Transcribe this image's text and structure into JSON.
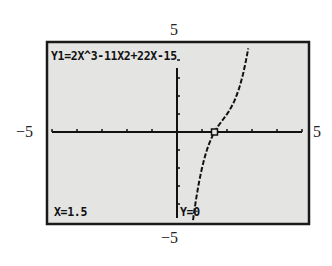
{
  "chart_data": {
    "type": "line",
    "title": "Y1=2X^3-11X2+22X-15",
    "function": "2x^3 - 11x^2 + 22x - 15",
    "xlim": [
      -5,
      5
    ],
    "ylim": [
      -5,
      5
    ],
    "xlabel": "",
    "ylabel": "",
    "grid": false,
    "x_tick_step": 1,
    "y_tick_step": 1,
    "series": [
      {
        "name": "Y1",
        "x": [
          0.6,
          0.7,
          0.8,
          0.9,
          1.0,
          1.1,
          1.2,
          1.3,
          1.4,
          1.5,
          1.6,
          1.7,
          1.8,
          1.9,
          2.0,
          2.1,
          2.2,
          2.3,
          2.4,
          2.5,
          2.6,
          2.7,
          2.8,
          2.9
        ],
        "y": [
          -5.33,
          -4.3,
          -3.42,
          -2.66,
          -2.0,
          -1.45,
          -0.98,
          -0.59,
          -0.27,
          0.0,
          0.23,
          0.42,
          0.58,
          0.71,
          1.0,
          1.05,
          1.18,
          1.33,
          1.53,
          2.5,
          2.87,
          3.55,
          4.26,
          5.13
        ]
      }
    ],
    "trace_point": {
      "x": 1.5,
      "y": 0
    },
    "labels": {
      "ymax": "5",
      "ymin": "−5",
      "xmin": "−5",
      "xmax": "5"
    },
    "readout": {
      "x": "X=1.5",
      "y": "Y=0"
    }
  }
}
